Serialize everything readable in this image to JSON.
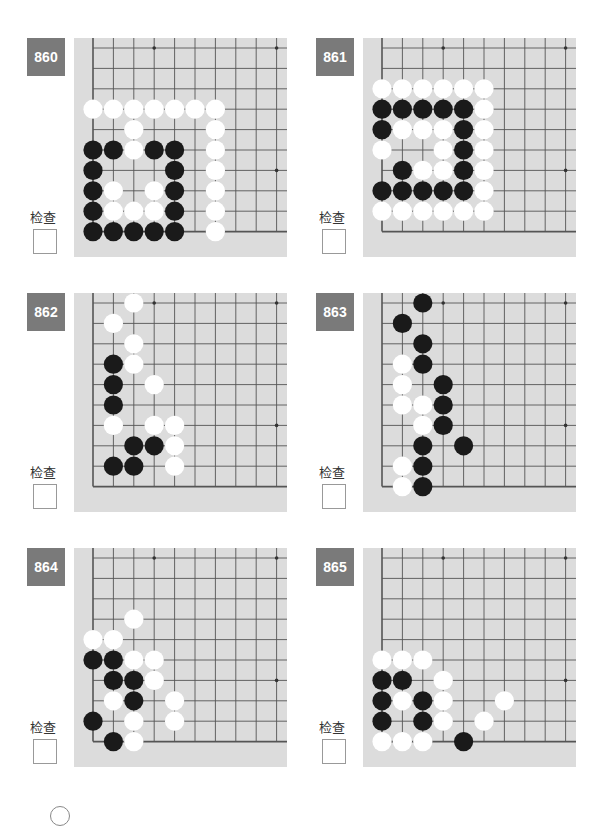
{
  "check_label": "检查",
  "colors": {
    "board": "#dcdcdc",
    "line": "#555555",
    "badge": "#7a7a7a",
    "black": "#1a1a1a",
    "white": "#ffffff"
  },
  "grid": {
    "cols": 10,
    "rows": 10,
    "spacing": 20.4,
    "origin_x": 19,
    "origin_y": 10,
    "star_points": [
      [
        3,
        0
      ],
      [
        9,
        0
      ],
      [
        9,
        6
      ]
    ]
  },
  "problems": [
    {
      "number": "860",
      "pos": [
        27,
        38
      ],
      "stones": [
        [
          "W",
          0,
          3
        ],
        [
          "W",
          1,
          3
        ],
        [
          "W",
          2,
          3
        ],
        [
          "W",
          3,
          3
        ],
        [
          "W",
          4,
          3
        ],
        [
          "W",
          5,
          3
        ],
        [
          "W",
          6,
          3
        ],
        [
          "W",
          2,
          4
        ],
        [
          "W",
          6,
          4
        ],
        [
          "B",
          0,
          5
        ],
        [
          "B",
          1,
          5
        ],
        [
          "W",
          2,
          5
        ],
        [
          "B",
          3,
          5
        ],
        [
          "B",
          4,
          5
        ],
        [
          "W",
          6,
          5
        ],
        [
          "B",
          0,
          6
        ],
        [
          "B",
          4,
          6
        ],
        [
          "W",
          6,
          6
        ],
        [
          "B",
          0,
          7
        ],
        [
          "W",
          1,
          7
        ],
        [
          "W",
          3,
          7
        ],
        [
          "B",
          4,
          7
        ],
        [
          "W",
          6,
          7
        ],
        [
          "B",
          0,
          8
        ],
        [
          "W",
          1,
          8
        ],
        [
          "W",
          2,
          8
        ],
        [
          "W",
          3,
          8
        ],
        [
          "B",
          4,
          8
        ],
        [
          "W",
          6,
          8
        ],
        [
          "B",
          0,
          9
        ],
        [
          "B",
          1,
          9
        ],
        [
          "B",
          2,
          9
        ],
        [
          "B",
          3,
          9
        ],
        [
          "B",
          4,
          9
        ],
        [
          "W",
          6,
          9
        ]
      ]
    },
    {
      "number": "861",
      "pos": [
        316,
        38
      ],
      "stones": [
        [
          "W",
          0,
          2
        ],
        [
          "W",
          1,
          2
        ],
        [
          "W",
          2,
          2
        ],
        [
          "W",
          3,
          2
        ],
        [
          "W",
          4,
          2
        ],
        [
          "W",
          5,
          2
        ],
        [
          "B",
          0,
          3
        ],
        [
          "B",
          1,
          3
        ],
        [
          "B",
          2,
          3
        ],
        [
          "B",
          3,
          3
        ],
        [
          "B",
          4,
          3
        ],
        [
          "W",
          5,
          3
        ],
        [
          "B",
          0,
          4
        ],
        [
          "W",
          1,
          4
        ],
        [
          "W",
          2,
          4
        ],
        [
          "W",
          3,
          4
        ],
        [
          "B",
          4,
          4
        ],
        [
          "W",
          5,
          4
        ],
        [
          "W",
          0,
          5
        ],
        [
          "W",
          3,
          5
        ],
        [
          "B",
          4,
          5
        ],
        [
          "W",
          5,
          5
        ],
        [
          "B",
          1,
          6
        ],
        [
          "W",
          2,
          6
        ],
        [
          "W",
          3,
          6
        ],
        [
          "B",
          4,
          6
        ],
        [
          "W",
          5,
          6
        ],
        [
          "B",
          0,
          7
        ],
        [
          "B",
          1,
          7
        ],
        [
          "B",
          2,
          7
        ],
        [
          "B",
          3,
          7
        ],
        [
          "B",
          4,
          7
        ],
        [
          "W",
          5,
          7
        ],
        [
          "W",
          0,
          8
        ],
        [
          "W",
          1,
          8
        ],
        [
          "W",
          2,
          8
        ],
        [
          "W",
          3,
          8
        ],
        [
          "W",
          4,
          8
        ],
        [
          "W",
          5,
          8
        ]
      ]
    },
    {
      "number": "862",
      "pos": [
        27,
        293
      ],
      "stones": [
        [
          "W",
          2,
          0
        ],
        [
          "W",
          1,
          1
        ],
        [
          "W",
          2,
          2
        ],
        [
          "B",
          1,
          3
        ],
        [
          "W",
          2,
          3
        ],
        [
          "B",
          1,
          4
        ],
        [
          "W",
          3,
          4
        ],
        [
          "B",
          1,
          5
        ],
        [
          "W",
          1,
          6
        ],
        [
          "W",
          3,
          6
        ],
        [
          "W",
          4,
          6
        ],
        [
          "B",
          2,
          7
        ],
        [
          "B",
          3,
          7
        ],
        [
          "W",
          4,
          7
        ],
        [
          "B",
          1,
          8
        ],
        [
          "B",
          2,
          8
        ],
        [
          "W",
          4,
          8
        ]
      ]
    },
    {
      "number": "863",
      "pos": [
        316,
        293
      ],
      "stones": [
        [
          "B",
          2,
          0
        ],
        [
          "B",
          1,
          1
        ],
        [
          "B",
          2,
          2
        ],
        [
          "W",
          1,
          3
        ],
        [
          "B",
          2,
          3
        ],
        [
          "W",
          1,
          4
        ],
        [
          "B",
          3,
          4
        ],
        [
          "W",
          1,
          5
        ],
        [
          "W",
          2,
          5
        ],
        [
          "B",
          3,
          5
        ],
        [
          "W",
          2,
          6
        ],
        [
          "B",
          3,
          6
        ],
        [
          "B",
          2,
          7
        ],
        [
          "B",
          4,
          7
        ],
        [
          "W",
          1,
          8
        ],
        [
          "B",
          2,
          8
        ],
        [
          "W",
          1,
          9
        ],
        [
          "B",
          2,
          9
        ]
      ]
    },
    {
      "number": "864",
      "pos": [
        27,
        548
      ],
      "stones": [
        [
          "W",
          2,
          3
        ],
        [
          "W",
          0,
          4
        ],
        [
          "W",
          1,
          4
        ],
        [
          "B",
          0,
          5
        ],
        [
          "B",
          1,
          5
        ],
        [
          "W",
          2,
          5
        ],
        [
          "W",
          3,
          5
        ],
        [
          "B",
          1,
          6
        ],
        [
          "B",
          2,
          6
        ],
        [
          "W",
          3,
          6
        ],
        [
          "W",
          1,
          7
        ],
        [
          "B",
          2,
          7
        ],
        [
          "W",
          4,
          7
        ],
        [
          "B",
          0,
          8
        ],
        [
          "W",
          2,
          8
        ],
        [
          "W",
          4,
          8
        ],
        [
          "B",
          1,
          9
        ],
        [
          "W",
          2,
          9
        ]
      ]
    },
    {
      "number": "865",
      "pos": [
        316,
        548
      ],
      "stones": [
        [
          "W",
          0,
          5
        ],
        [
          "W",
          1,
          5
        ],
        [
          "W",
          2,
          5
        ],
        [
          "B",
          0,
          6
        ],
        [
          "B",
          1,
          6
        ],
        [
          "W",
          3,
          6
        ],
        [
          "B",
          0,
          7
        ],
        [
          "W",
          1,
          7
        ],
        [
          "B",
          2,
          7
        ],
        [
          "W",
          3,
          7
        ],
        [
          "W",
          6,
          7
        ],
        [
          "B",
          0,
          8
        ],
        [
          "B",
          2,
          8
        ],
        [
          "W",
          3,
          8
        ],
        [
          "W",
          5,
          8
        ],
        [
          "W",
          0,
          9
        ],
        [
          "W",
          1,
          9
        ],
        [
          "W",
          2,
          9
        ],
        [
          "B",
          4,
          9
        ]
      ]
    }
  ]
}
